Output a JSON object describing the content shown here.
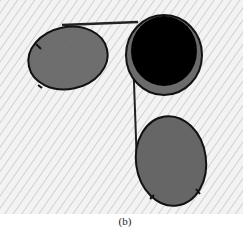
{
  "figure": {
    "caption": "(b)",
    "background": {
      "color": "#f2f2f2",
      "hatch_color": "#c8c8c8",
      "x": 0,
      "y": 0,
      "width": 243,
      "height": 214
    },
    "shapes": [
      {
        "id": "left-ellipse",
        "cx": 68,
        "cy": 58,
        "rx": 40,
        "ry": 31,
        "rotate": -12,
        "fill": "#666666",
        "stroke": "#111111"
      },
      {
        "id": "top-right-ellipse",
        "cx": 164,
        "cy": 54,
        "rx": 39,
        "ry": 40,
        "rotate": 0,
        "fill": "#6a6a6a",
        "stroke": "#111111"
      },
      {
        "id": "top-right-disc",
        "cx": 165,
        "cy": 51,
        "r": 35,
        "fill": "#000000"
      },
      {
        "id": "bottom-ellipse",
        "cx": 171,
        "cy": 161,
        "rx": 36,
        "ry": 45,
        "rotate": -8,
        "fill": "#666666",
        "stroke": "#111111"
      }
    ],
    "connectors": [
      {
        "id": "top-bar",
        "x1": 64,
        "y1": 25,
        "x2": 137,
        "y2": 22
      },
      {
        "id": "vertical-link",
        "x1": 132,
        "y1": 55,
        "x2": 137,
        "y2": 165
      }
    ]
  }
}
